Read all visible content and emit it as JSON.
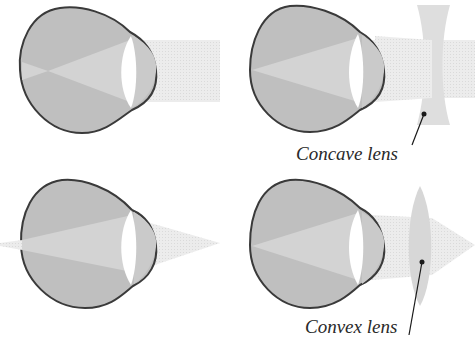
{
  "diagram": {
    "type": "optics-eye-correction",
    "panels": [
      {
        "id": "myopia-uncorrected",
        "description": "Nearsighted eye: parallel rays focus in front of retina",
        "lens": null
      },
      {
        "id": "myopia-corrected",
        "description": "Nearsighted eye corrected with concave lens",
        "lens": "concave"
      },
      {
        "id": "hyperopia-uncorrected",
        "description": "Farsighted eye: near rays focus behind retina",
        "lens": null
      },
      {
        "id": "hyperopia-corrected",
        "description": "Farsighted eye corrected with convex lens",
        "lens": "convex"
      }
    ],
    "labels": {
      "concave": "Concave lens",
      "convex": "Convex lens"
    },
    "colors": {
      "eye_fill": "#bdbdbd",
      "eye_outline": "#3a3a3a",
      "light_beam": "#e6e6e6",
      "inner_beam": "#d2d2d2",
      "cornea": "#c8c8c8",
      "eye_lens": "#ffffff",
      "corrective_lens": "#dcdcdc",
      "leader_line": "#1a1a1a"
    }
  }
}
